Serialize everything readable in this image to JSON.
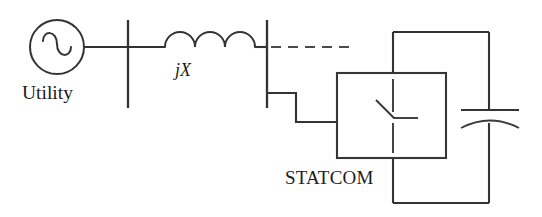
{
  "figure": {
    "kind": "single-line-diagram",
    "title_visible": false,
    "background_color": "#ffffff",
    "line_color": "#333336",
    "text_color": "#1c1c20"
  },
  "labels": {
    "utility": "Utility",
    "reactance": "jX",
    "statcom": "STATCOM"
  },
  "components": {
    "source": {
      "name": "ac-voltage-source",
      "symbol": "circle-with-sine-wave",
      "label": "Utility"
    },
    "bus_left": {
      "name": "bus-bar-left",
      "symbol": "vertical-bus-bar"
    },
    "inductor": {
      "name": "series-reactance",
      "symbol": "three-arc-coil",
      "label": "jX",
      "arcs": 3
    },
    "bus_right": {
      "name": "bus-bar-right",
      "symbol": "vertical-bus-bar"
    },
    "feeder_dashed": {
      "name": "dashed-feeder-line",
      "symbol": "dashed-line"
    },
    "statcom": {
      "name": "statcom-block",
      "symbol": "rectangle-with-switch",
      "label": "STATCOM",
      "inner_symbol": "switch-thyristor"
    },
    "capacitor": {
      "name": "dc-link-capacitor",
      "symbol": "polarized-capacitor"
    }
  }
}
